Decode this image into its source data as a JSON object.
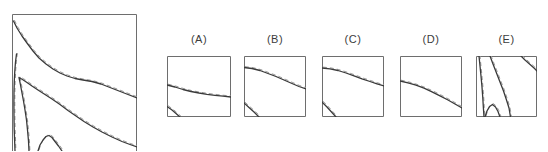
{
  "figure": {
    "background": "#ffffff",
    "colors": {
      "solid_line": "#3a3a3a",
      "dashed_line": "#9c9c9c",
      "panel_border": "#6e6e6e",
      "label_text": "#3c3c3c"
    },
    "line_styles": {
      "solid_width": 1.3,
      "dashed_width": 1.0,
      "dash_pattern": "4 3",
      "dash_offset_x": 0.9,
      "dash_offset_y": -0.9
    }
  },
  "chart_data": {
    "type": "line",
    "title": "",
    "legend": [],
    "panels": [
      {
        "id": "main",
        "label": "",
        "box": {
          "x": 12,
          "y": 14,
          "w": 125,
          "h": 143
        },
        "open_bottom": true,
        "curves": [
          {
            "name": "top-contour",
            "points": [
              [
                1.5,
                7
              ],
              [
                5,
                14
              ],
              [
                10,
                22
              ],
              [
                15,
                29
              ],
              [
                21,
                37
              ],
              [
                27,
                44
              ],
              [
                34,
                50
              ],
              [
                41,
                55
              ],
              [
                48,
                59
              ],
              [
                55,
                62
              ],
              [
                63,
                64.5
              ],
              [
                71,
                66
              ],
              [
                80,
                67.5
              ],
              [
                89,
                70
              ],
              [
                98,
                73.5
              ],
              [
                107,
                77
              ],
              [
                116,
                80.5
              ],
              [
                125,
                84
              ]
            ]
          },
          {
            "name": "wedge-contour",
            "points": [
              [
                17,
                137
              ],
              [
                16.5,
                127
              ],
              [
                15.5,
                116
              ],
              [
                14.5,
                106
              ],
              [
                13,
                96
              ],
              [
                11.5,
                87
              ],
              [
                10,
                79
              ],
              [
                8.5,
                71
              ],
              [
                7,
                63.5
              ],
              [
                10.5,
                65.5
              ],
              [
                15,
                68.5
              ],
              [
                20,
                72
              ],
              [
                26,
                76
              ],
              [
                33,
                80.5
              ],
              [
                40,
                85
              ],
              [
                48,
                90.5
              ],
              [
                56,
                96.5
              ],
              [
                64,
                102
              ],
              [
                72,
                107.5
              ],
              [
                81,
                113
              ],
              [
                90,
                118
              ],
              [
                100,
                123
              ],
              [
                110,
                127.5
              ],
              [
                118,
                130.5
              ],
              [
                125,
                133
              ]
            ]
          },
          {
            "name": "left-edge-contour",
            "points": [
              [
                4.5,
                40
              ],
              [
                3.5,
                48
              ],
              [
                2.8,
                57
              ],
              [
                2.3,
                67
              ],
              [
                2,
                78
              ],
              [
                1.9,
                90
              ],
              [
                2,
                103
              ],
              [
                2.2,
                115
              ],
              [
                2.6,
                126
              ],
              [
                3,
                137
              ]
            ]
          },
          {
            "name": "bottom-arch-contour",
            "points": [
              [
                26,
                137
              ],
              [
                28,
                131
              ],
              [
                31,
                126
              ],
              [
                34,
                122.5
              ],
              [
                37,
                121.5
              ],
              [
                40,
                123.5
              ],
              [
                43,
                127.5
              ],
              [
                46.5,
                132
              ],
              [
                50,
                137
              ]
            ]
          }
        ]
      },
      {
        "id": "A",
        "label": "(A)",
        "box": {
          "x": 167,
          "y": 56,
          "w": 64,
          "h": 61
        },
        "open_bottom": false,
        "curves": [
          {
            "name": "main-contour",
            "points": [
              [
                0,
                29
              ],
              [
                8,
                31
              ],
              [
                16,
                33.5
              ],
              [
                24,
                35.5
              ],
              [
                32,
                37
              ],
              [
                40,
                38.3
              ],
              [
                48,
                39.3
              ],
              [
                56,
                40.2
              ],
              [
                64,
                41
              ]
            ]
          },
          {
            "name": "corner-contour",
            "points": [
              [
                0,
                50.5
              ],
              [
                5,
                54
              ],
              [
                9,
                57.5
              ],
              [
                13,
                61
              ]
            ]
          }
        ]
      },
      {
        "id": "B",
        "label": "(B)",
        "box": {
          "x": 244,
          "y": 56,
          "w": 62,
          "h": 61
        },
        "open_bottom": false,
        "curves": [
          {
            "name": "main-contour",
            "points": [
              [
                0,
                11.5
              ],
              [
                8,
                12.5
              ],
              [
                16,
                14.5
              ],
              [
                24,
                17.5
              ],
              [
                32,
                20.5
              ],
              [
                40,
                24
              ],
              [
                48,
                27.5
              ],
              [
                55,
                30.5
              ],
              [
                62,
                33
              ]
            ]
          },
          {
            "name": "corner-contour",
            "points": [
              [
                0,
                47
              ],
              [
                5,
                51.5
              ],
              [
                10,
                56
              ],
              [
                15,
                61
              ]
            ]
          }
        ]
      },
      {
        "id": "C",
        "label": "(C)",
        "box": {
          "x": 322,
          "y": 56,
          "w": 62,
          "h": 61
        },
        "open_bottom": false,
        "curves": [
          {
            "name": "main-contour",
            "points": [
              [
                0,
                12
              ],
              [
                8,
                12.8
              ],
              [
                16,
                14.5
              ],
              [
                24,
                17
              ],
              [
                32,
                19.8
              ],
              [
                40,
                22.8
              ],
              [
                48,
                25.5
              ],
              [
                55,
                27.8
              ],
              [
                62,
                30
              ]
            ]
          },
          {
            "name": "corner-contour",
            "points": [
              [
                0,
                46
              ],
              [
                5,
                51
              ],
              [
                9.5,
                56
              ],
              [
                14,
                61
              ]
            ]
          }
        ]
      },
      {
        "id": "D",
        "label": "(D)",
        "box": {
          "x": 400,
          "y": 56,
          "w": 62,
          "h": 61
        },
        "open_bottom": false,
        "curves": [
          {
            "name": "main-contour",
            "points": [
              [
                0,
                25
              ],
              [
                8,
                26.8
              ],
              [
                16,
                29.2
              ],
              [
                24,
                32.2
              ],
              [
                32,
                35.8
              ],
              [
                40,
                39.8
              ],
              [
                48,
                44
              ],
              [
                55,
                48
              ],
              [
                62,
                52
              ]
            ]
          }
        ]
      },
      {
        "id": "E",
        "label": "(E)",
        "box": {
          "x": 476,
          "y": 56,
          "w": 61,
          "h": 61
        },
        "open_bottom": false,
        "curves": [
          {
            "name": "left-vertical-contour",
            "points": [
              [
                3,
                0
              ],
              [
                4,
                10
              ],
              [
                5,
                20
              ],
              [
                6,
                31
              ],
              [
                6.8,
                42
              ],
              [
                7.4,
                52
              ],
              [
                8,
                61
              ]
            ]
          },
          {
            "name": "diagonal-contour",
            "points": [
              [
                14,
                0
              ],
              [
                17,
                8
              ],
              [
                20.5,
                17
              ],
              [
                24,
                26
              ],
              [
                27.5,
                35
              ],
              [
                30.5,
                44
              ],
              [
                33,
                52
              ],
              [
                34.5,
                61
              ]
            ]
          },
          {
            "name": "arch-contour",
            "points": [
              [
                9,
                61
              ],
              [
                11,
                55
              ],
              [
                13.5,
                50.5
              ],
              [
                16.5,
                48.5
              ],
              [
                19.5,
                51
              ],
              [
                22,
                55.5
              ],
              [
                24,
                61
              ]
            ]
          },
          {
            "name": "corner-contour",
            "points": [
              [
                45,
                0
              ],
              [
                49,
                4
              ],
              [
                53.5,
                8
              ],
              [
                58,
                12
              ],
              [
                61,
                15
              ]
            ]
          }
        ]
      }
    ]
  }
}
